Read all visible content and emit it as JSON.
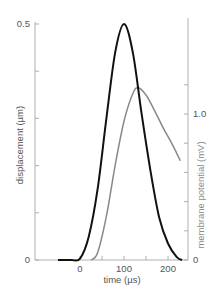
{
  "chart_data": {
    "type": "line",
    "title": "",
    "xlabel": "time (µs)",
    "ylabel": "displacement (µm)",
    "y2label": "membrane potential (mV)",
    "xlim": [
      -60,
      235
    ],
    "ylim": [
      0,
      0.5
    ],
    "y2lim": [
      0,
      1.6
    ],
    "x_ticks": [
      0,
      100,
      200
    ],
    "x_tick_labels": [
      "0",
      "100",
      "200"
    ],
    "x_minor_ticks": [
      50,
      150
    ],
    "y_ticks": [
      0,
      0.1,
      0.2,
      0.3,
      0.4,
      0.5
    ],
    "y_tick_labels": [
      "0",
      "",
      "",
      "",
      "",
      "0.5"
    ],
    "y2_ticks": [
      0,
      0.2,
      0.4,
      0.6,
      0.8,
      1.0,
      1.2
    ],
    "y2_tick_labels": [
      "0",
      "",
      "",
      "",
      "",
      "1.0",
      ""
    ],
    "grid": false,
    "legend": null,
    "series": [
      {
        "name": "displacement",
        "axis": "left",
        "color": "#111111",
        "x": [
          -50,
          -20,
          0,
          20,
          40,
          60,
          80,
          100,
          120,
          140,
          160,
          180,
          200,
          220,
          232
        ],
        "y": [
          0,
          0,
          0.003,
          0.05,
          0.15,
          0.3,
          0.44,
          0.5,
          0.44,
          0.31,
          0.19,
          0.09,
          0.035,
          0.006,
          0
        ]
      },
      {
        "name": "membrane potential",
        "axis": "right",
        "color": "#888888",
        "x": [
          25,
          40,
          60,
          80,
          100,
          120,
          132,
          150,
          170,
          190,
          210,
          228
        ],
        "y": [
          0,
          0.05,
          0.3,
          0.65,
          0.95,
          1.14,
          1.18,
          1.13,
          1.02,
          0.9,
          0.79,
          0.68
        ]
      }
    ]
  },
  "labels": {
    "x_axis": "time (µs)",
    "y_axis_left": "displacement (µm)",
    "y_axis_right": "membrane potential (mV)",
    "y_left_top": "0.5",
    "y_left_bottom": "0",
    "y_right_mid": "1.0",
    "y_right_bottom": "0",
    "x_0": "0",
    "x_100": "100",
    "x_200": "200"
  }
}
